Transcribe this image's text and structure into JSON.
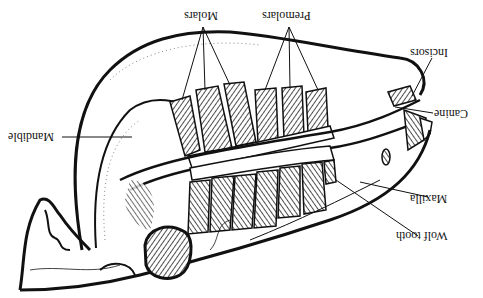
{
  "diagram": {
    "orientation": "rotated 180 degrees",
    "labels": {
      "molars": "Molars",
      "premolars": "Premolars",
      "incisors": "Incisors",
      "canine": "Canine",
      "mandible": "Mandible",
      "maxilla": "Maxilla",
      "wolf_tooth": "Wolf tooth"
    },
    "colors": {
      "ink": "#111111",
      "background": "#ffffff",
      "hatch": "#333333"
    }
  }
}
